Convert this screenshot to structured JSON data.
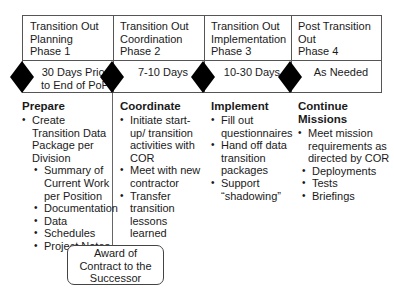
{
  "phases": [
    {
      "title_line1": "Transition Out",
      "title_line2": "Planning",
      "title_line3": "Phase 1",
      "duration_line1": "30 Days Prior",
      "duration_line2": "to End of PoP"
    },
    {
      "title_line1": "Transition Out",
      "title_line2": "Coordination",
      "title_line3": "Phase 2",
      "duration_line1": "7-10 Days",
      "duration_line2": ""
    },
    {
      "title_line1": "Transition Out",
      "title_line2": "Implementation",
      "title_line3": "Phase 3",
      "duration_line1": "10-30 Days",
      "duration_line2": ""
    },
    {
      "title_line1": "Post Transition",
      "title_line2": "Out",
      "title_line3": "Phase 4",
      "duration_line1": "As Needed",
      "duration_line2": ""
    }
  ],
  "activities": [
    {
      "heading": "Prepare",
      "items": [
        {
          "text": "Create Transition Data Package per Division",
          "subitems": [
            "Summary of Current Work per Position",
            "Documentation",
            "Data",
            "Schedules",
            "Project Notes"
          ]
        }
      ]
    },
    {
      "heading": "Coordinate",
      "items": [
        {
          "text": "Initiate start-up/ transition activities with COR"
        },
        {
          "text": "Meet with new contractor"
        },
        {
          "text": "Transfer transition lessons learned"
        }
      ]
    },
    {
      "heading": "Implement",
      "items": [
        {
          "text": "Fill out questionnaires"
        },
        {
          "text": "Hand off data transition packages"
        },
        {
          "text": "Support “shadowing”"
        }
      ]
    },
    {
      "heading": "Continue Missions",
      "items": [
        {
          "text": "Meet mission requirements as directed by COR",
          "subitems": [
            "Deployments",
            "Tests",
            "Briefings"
          ]
        }
      ]
    }
  ],
  "milestone": {
    "line1": "Award of",
    "line2": "Contract to the",
    "line3": "Successor"
  },
  "colors": {
    "border": "#555555",
    "diamond": "#000000",
    "text": "#1a1a1a"
  }
}
